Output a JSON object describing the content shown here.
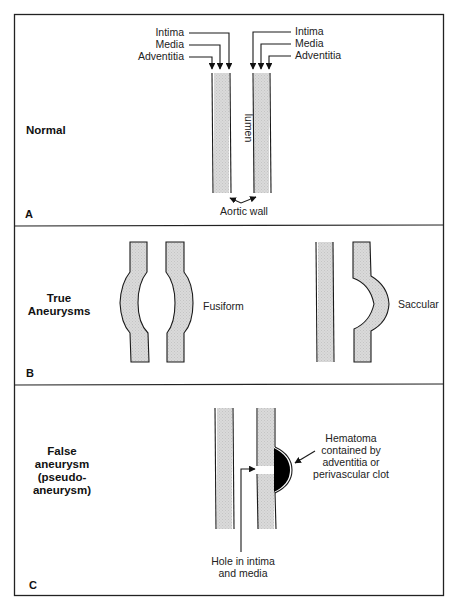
{
  "figure": {
    "panels": [
      {
        "letter": "A",
        "title": "Normal",
        "labels_left": [
          "Intima",
          "Media",
          "Adventitia"
        ],
        "labels_right": [
          "Intima",
          "Media",
          "Adventitia"
        ],
        "lumen_label": "lumen",
        "wall_label": "Aortic wall"
      },
      {
        "letter": "B",
        "title_line1": "True",
        "title_line2": "Aneurysms",
        "types": [
          "Fusiform",
          "Saccular"
        ]
      },
      {
        "letter": "C",
        "title_lines": [
          "False",
          "aneurysm",
          "(pseudo-",
          "aneurysm)"
        ],
        "hematoma_lines": [
          "Hematoma",
          "contained by",
          "adventitia or",
          "perivascular clot"
        ],
        "hole_lines": [
          "Hole in intima",
          "and media"
        ]
      }
    ],
    "colors": {
      "line": "#1a1a1a",
      "wall_fill": "#d6d6d6",
      "hematoma": "#000000",
      "background": "#ffffff"
    }
  }
}
